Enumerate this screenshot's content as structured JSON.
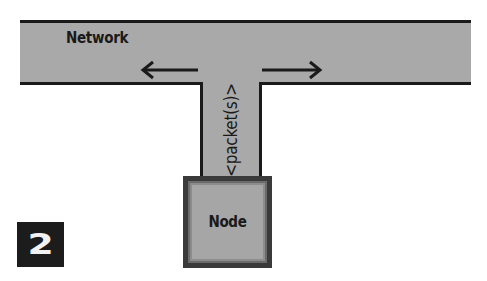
{
  "diagram": {
    "network": {
      "label": "Network"
    },
    "connection": {
      "label": "<packet(s)>"
    },
    "node": {
      "label": "Node"
    },
    "figure_badge": {
      "number": "2"
    },
    "arrows": [
      {
        "name": "arrow-left",
        "direction": "left"
      },
      {
        "name": "arrow-right",
        "direction": "right"
      }
    ],
    "colors": {
      "fill": "#a9a9a9",
      "border": "#1a1a1a",
      "badge_bg": "#1c1c1c",
      "badge_text": "#f2f2f2"
    }
  }
}
